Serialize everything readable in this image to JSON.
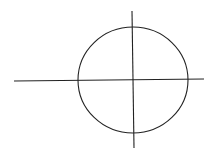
{
  "diagram": {
    "stroke_color": "#222222",
    "background": "#ffffff",
    "circle": {
      "cx": 133,
      "cy": 80,
      "rx": 55,
      "ry": 53
    },
    "horizontal_axis": {
      "x1": 14,
      "y1": 81,
      "x2": 204,
      "y2": 79
    },
    "vertical_axis": {
      "x1": 132,
      "y1": 11,
      "x2": 134,
      "y2": 148
    }
  }
}
